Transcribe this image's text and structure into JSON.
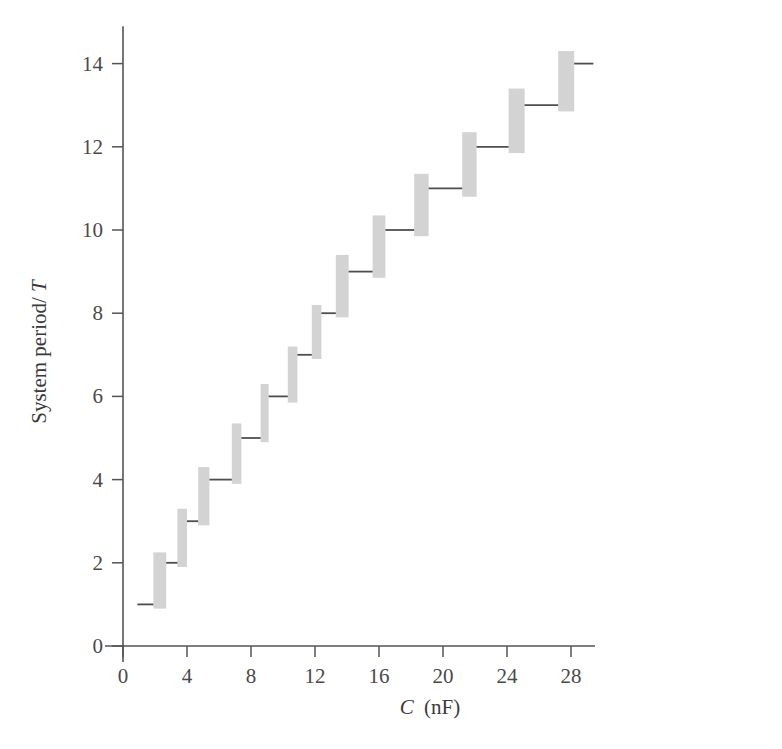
{
  "chart_data": {
    "type": "line",
    "title": "",
    "subtitle": "",
    "xlabel": "C (nF)",
    "xlabel_symbol": "C",
    "xlabel_unit": "(nF)",
    "ylabel": "System period/T",
    "ylabel_prefix": "System period/",
    "ylabel_symbol": "T",
    "xlim": [
      0,
      29.5
    ],
    "ylim": [
      0,
      14.9
    ],
    "xticks": [
      0,
      4,
      8,
      12,
      16,
      20,
      24,
      28
    ],
    "yticks": [
      0,
      2,
      4,
      6,
      8,
      10,
      12,
      14
    ],
    "xtick_labels": [
      "0",
      "4",
      "8",
      "12",
      "16",
      "20",
      "24",
      "28"
    ],
    "ytick_labels": [
      "0",
      "2",
      "4",
      "6",
      "8",
      "10",
      "12",
      "14"
    ],
    "grid": false,
    "legend": null,
    "colors": {
      "band": "#d3d3d3",
      "line": "#4e4e4e",
      "axis": "#545454",
      "text": "#3a3a3a",
      "background": "#ffffff"
    },
    "plateaus": [
      {
        "period": 1,
        "c_start": 0.9,
        "c_end": 1.9
      },
      {
        "period": 2,
        "c_start": 2.7,
        "c_end": 3.4
      },
      {
        "period": 3,
        "c_start": 4.0,
        "c_end": 4.7
      },
      {
        "period": 4,
        "c_start": 5.4,
        "c_end": 6.8
      },
      {
        "period": 5,
        "c_start": 7.4,
        "c_end": 8.6
      },
      {
        "period": 6,
        "c_start": 9.1,
        "c_end": 10.3
      },
      {
        "period": 7,
        "c_start": 10.9,
        "c_end": 11.8
      },
      {
        "period": 8,
        "c_start": 12.4,
        "c_end": 13.3
      },
      {
        "period": 9,
        "c_start": 14.1,
        "c_end": 15.6
      },
      {
        "period": 10,
        "c_start": 16.4,
        "c_end": 18.2
      },
      {
        "period": 11,
        "c_start": 19.1,
        "c_end": 21.2
      },
      {
        "period": 12,
        "c_start": 22.1,
        "c_end": 24.1
      },
      {
        "period": 13,
        "c_start": 25.1,
        "c_end": 27.2
      },
      {
        "period": 14,
        "c_start": 28.2,
        "c_end": 29.4
      }
    ],
    "transitions": [
      {
        "c_start": 1.9,
        "c_end": 2.7,
        "t_low": 0.9,
        "t_high": 2.25
      },
      {
        "c_start": 3.4,
        "c_end": 4.0,
        "t_low": 1.9,
        "t_high": 3.3
      },
      {
        "c_start": 4.7,
        "c_end": 5.4,
        "t_low": 2.9,
        "t_high": 4.3
      },
      {
        "c_start": 6.8,
        "c_end": 7.4,
        "t_low": 3.9,
        "t_high": 5.35
      },
      {
        "c_start": 8.6,
        "c_end": 9.1,
        "t_low": 4.9,
        "t_high": 6.3
      },
      {
        "c_start": 10.3,
        "c_end": 10.9,
        "t_low": 5.85,
        "t_high": 7.2
      },
      {
        "c_start": 11.8,
        "c_end": 12.4,
        "t_low": 6.9,
        "t_high": 8.2
      },
      {
        "c_start": 13.3,
        "c_end": 14.1,
        "t_low": 7.9,
        "t_high": 9.4
      },
      {
        "c_start": 15.6,
        "c_end": 16.4,
        "t_low": 8.85,
        "t_high": 10.35
      },
      {
        "c_start": 18.2,
        "c_end": 19.1,
        "t_low": 9.85,
        "t_high": 11.35
      },
      {
        "c_start": 21.2,
        "c_end": 22.1,
        "t_low": 10.8,
        "t_high": 12.35
      },
      {
        "c_start": 24.1,
        "c_end": 25.1,
        "t_low": 11.85,
        "t_high": 13.4
      },
      {
        "c_start": 27.2,
        "c_end": 28.2,
        "t_low": 12.85,
        "t_high": 14.3
      }
    ]
  }
}
